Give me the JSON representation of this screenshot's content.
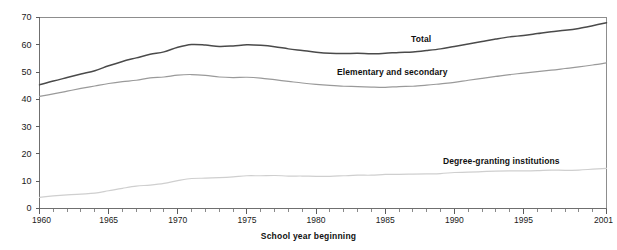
{
  "chart_data": {
    "type": "line",
    "title": "",
    "subtitle": "",
    "xlabel": "School year beginning",
    "ylabel": "",
    "xlim": [
      1960,
      2001
    ],
    "ylim": [
      0,
      70
    ],
    "grid": false,
    "legend_position": "inline-labels",
    "y_ticks": [
      0,
      10,
      20,
      30,
      40,
      50,
      60,
      70
    ],
    "x_ticks_major": [
      1960,
      1965,
      1970,
      1975,
      1980,
      1985,
      1990,
      1995,
      2001
    ],
    "x_tick_interval_minor": 1,
    "x": [
      1960,
      1961,
      1962,
      1963,
      1964,
      1965,
      1966,
      1967,
      1968,
      1969,
      1970,
      1971,
      1972,
      1973,
      1974,
      1975,
      1976,
      1977,
      1978,
      1979,
      1980,
      1981,
      1982,
      1983,
      1984,
      1985,
      1986,
      1987,
      1988,
      1989,
      1990,
      1991,
      1992,
      1993,
      1994,
      1995,
      1996,
      1997,
      1998,
      1999,
      2000,
      2001
    ],
    "series": [
      {
        "name": "Total",
        "color": "#4a4a4a",
        "values": [
          45.3,
          46.7,
          48.0,
          49.3,
          50.5,
          52.3,
          53.9,
          55.2,
          56.5,
          57.4,
          59.1,
          60.1,
          59.9,
          59.4,
          59.6,
          60.0,
          59.8,
          59.3,
          58.5,
          57.9,
          57.3,
          56.9,
          56.8,
          56.9,
          56.7,
          56.9,
          57.2,
          57.4,
          57.9,
          58.5,
          59.4,
          60.3,
          61.2,
          62.1,
          62.9,
          63.4,
          64.1,
          64.8,
          65.3,
          66.0,
          67.0,
          68.1
        ]
      },
      {
        "name": "Elementary and secondary",
        "color": "#9a9a9a",
        "values": [
          41.1,
          42.0,
          43.0,
          44.0,
          44.9,
          45.8,
          46.5,
          47.0,
          47.9,
          48.2,
          48.9,
          49.1,
          48.8,
          48.2,
          48.0,
          48.1,
          47.8,
          47.2,
          46.6,
          46.0,
          45.5,
          45.1,
          44.8,
          44.7,
          44.5,
          44.4,
          44.7,
          44.8,
          45.2,
          45.7,
          46.2,
          47.0,
          47.7,
          48.4,
          49.1,
          49.6,
          50.2,
          50.7,
          51.3,
          51.9,
          52.6,
          53.4
        ]
      },
      {
        "name": "Degree-granting institutions",
        "color": "#cfcfcf",
        "values": [
          4.1,
          4.6,
          5.0,
          5.3,
          5.6,
          6.5,
          7.4,
          8.2,
          8.6,
          9.2,
          10.2,
          11.0,
          11.1,
          11.3,
          11.6,
          12.0,
          12.0,
          12.1,
          11.9,
          11.9,
          11.8,
          11.8,
          12.0,
          12.2,
          12.2,
          12.5,
          12.5,
          12.6,
          12.7,
          12.8,
          13.2,
          13.3,
          13.5,
          13.7,
          13.8,
          13.8,
          13.9,
          14.1,
          14.0,
          14.1,
          14.4,
          14.7
        ]
      }
    ],
    "annotations": [
      {
        "text": "Total",
        "x": 1987,
        "y": 63
      },
      {
        "text": "Elementary and secondary",
        "x": 1980,
        "y": 50
      },
      {
        "text": "Degree-granting institutions",
        "x": 1992,
        "y": 18
      }
    ]
  },
  "labels": {
    "series_total": "Total",
    "series_elementary": "Elementary and secondary",
    "series_degree": "Degree-granting institutions",
    "x_axis_title": "School year beginning"
  },
  "colors": {
    "total": "#4a4a4a",
    "elementary": "#9a9a9a",
    "degree": "#cfcfcf",
    "axis": "#6f6f6f",
    "frame": "#8d8d8d",
    "text": "#111111",
    "background": "#ffffff"
  }
}
